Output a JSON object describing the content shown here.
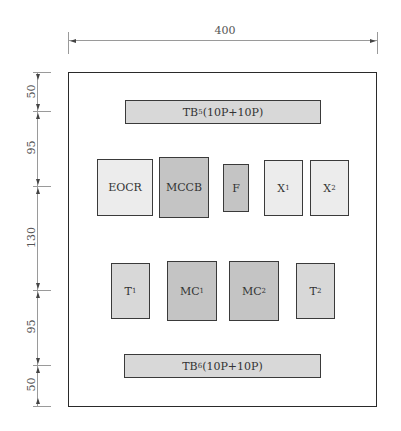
{
  "dimensions": {
    "width": {
      "label": "400"
    },
    "vertical": [
      {
        "label": "50"
      },
      {
        "label": "95"
      },
      {
        "label": "130"
      },
      {
        "label": "95"
      },
      {
        "label": "50"
      }
    ]
  },
  "terminal_blocks": {
    "top": {
      "name": "TB",
      "sub": "5",
      "spec": "(10P+10P)"
    },
    "bottom": {
      "name": "TB",
      "sub": "6",
      "spec": "(10P+10P)"
    }
  },
  "row1": [
    {
      "name": "EOCR",
      "sub": ""
    },
    {
      "name": "MCCB",
      "sub": ""
    },
    {
      "name": "F",
      "sub": ""
    },
    {
      "name": "X",
      "sub": "1"
    },
    {
      "name": "X",
      "sub": "2"
    }
  ],
  "row2": [
    {
      "name": "T",
      "sub": "1"
    },
    {
      "name": "MC",
      "sub": "1"
    },
    {
      "name": "MC",
      "sub": "2"
    },
    {
      "name": "T",
      "sub": "2"
    }
  ]
}
